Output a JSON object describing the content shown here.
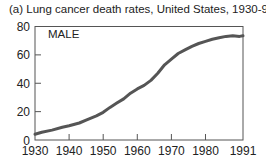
{
  "title": "(a) Lung cancer death rates, United States, 1930-91",
  "chart_data": {
    "type": "line",
    "title": "(a) Lung cancer death rates, United States, 1930-91",
    "xlabel": "",
    "ylabel": "",
    "xlim": [
      1930,
      1991
    ],
    "ylim": [
      0,
      80
    ],
    "x_ticks": [
      "1930",
      "1940",
      "1950",
      "1960",
      "1970",
      "1980",
      "1991"
    ],
    "y_ticks": [
      "0",
      "20",
      "40",
      "60",
      "80"
    ],
    "grid": false,
    "legend": null,
    "annotations": [
      "MALE"
    ],
    "series": [
      {
        "name": "MALE",
        "x": [
          1930,
          1932,
          1935,
          1938,
          1940,
          1943,
          1945,
          1948,
          1950,
          1952,
          1954,
          1956,
          1958,
          1960,
          1962,
          1964,
          1966,
          1968,
          1970,
          1972,
          1974,
          1976,
          1978,
          1980,
          1982,
          1984,
          1986,
          1988,
          1990,
          1991
        ],
        "values": [
          4,
          5.5,
          7,
          9,
          10,
          12,
          14,
          17,
          19.5,
          23,
          26,
          29,
          33,
          36,
          38.5,
          42,
          47,
          53,
          57,
          61,
          63.5,
          66,
          68,
          69.5,
          71,
          72,
          73,
          73.5,
          73,
          73.5
        ]
      }
    ]
  }
}
